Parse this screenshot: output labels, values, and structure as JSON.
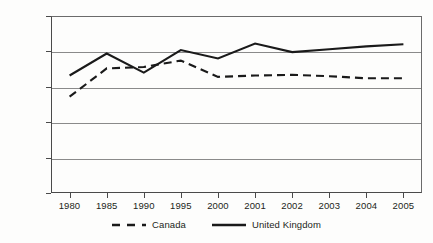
{
  "chart_data": {
    "type": "line",
    "title": "",
    "xlabel": "",
    "ylabel": "",
    "categories": [
      "1980",
      "1985",
      "1990",
      "1995",
      "2000",
      "2001",
      "2002",
      "2003",
      "2004",
      "2005"
    ],
    "ylim": [
      0,
      25
    ],
    "yticks": [
      "0.000",
      "5.000",
      "10.000",
      "15.000",
      "20.000",
      "25.000"
    ],
    "ytick_values": [
      0,
      5,
      10,
      15,
      20,
      25
    ],
    "grid": true,
    "legend_position": "bottom",
    "series": [
      {
        "name": "Canada",
        "style": "dashed",
        "color": "#1a1a1a",
        "values": [
          13.6,
          17.6,
          17.8,
          18.7,
          16.4,
          16.6,
          16.7,
          16.5,
          16.2,
          16.2
        ]
      },
      {
        "name": "United Kingdom",
        "style": "solid",
        "color": "#1a1a1a",
        "values": [
          16.6,
          19.7,
          17.0,
          20.2,
          19.0,
          21.1,
          19.9,
          20.3,
          20.7,
          21.0
        ]
      }
    ]
  },
  "legend": {
    "items": [
      {
        "label": "Canada",
        "style": "dashed"
      },
      {
        "label": "United Kingdom",
        "style": "solid"
      }
    ]
  },
  "colors": {
    "background": "#fdfdfc",
    "axis": "#4a4a4a",
    "gridline": "#8a8a8a",
    "series": "#1a1a1a",
    "text": "#231f20"
  }
}
